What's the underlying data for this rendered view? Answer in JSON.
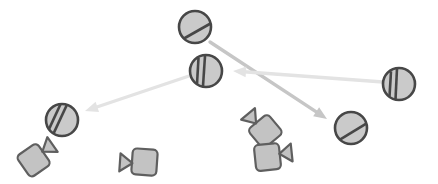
{
  "scene": {
    "description": "diagram of striped balls, video cameras and motion arrows",
    "width": 438,
    "height": 184,
    "background": "#ffffff",
    "colors": {
      "ball_fill": "#cacaca",
      "ball_stroke": "#474747",
      "camera_fill": "#c3c3c3",
      "camera_stroke": "#5f5f5f",
      "arrow_primary": "#c6c6c6",
      "arrow_faded": "#e3e3e3"
    },
    "balls": [
      {
        "id": "ball-top",
        "cx": 195,
        "cy": 27,
        "r": 16,
        "stripes": [
          [
            [
              184,
              38.5
            ],
            [
              210.5,
              23.5
            ]
          ]
        ]
      },
      {
        "id": "ball-middle",
        "cx": 206,
        "cy": 71,
        "r": 16,
        "stripes": [
          [
            [
              198.5,
              58
            ],
            [
              197,
              84
            ]
          ],
          [
            [
              205,
              56
            ],
            [
              203,
              86
            ]
          ]
        ]
      },
      {
        "id": "ball-right",
        "cx": 399,
        "cy": 84,
        "r": 16,
        "stripes": [
          [
            [
              391,
              71.4
            ],
            [
              389.5,
              96.6
            ]
          ],
          [
            [
              397,
              68.8
            ],
            [
              395.5,
              99.2
            ]
          ]
        ]
      },
      {
        "id": "ball-bottom-left",
        "cx": 62,
        "cy": 120,
        "r": 16,
        "stripes": [
          [
            [
              60.4,
              104.5
            ],
            [
              49.2,
              128.6
            ]
          ],
          [
            [
              66.7,
              105.2
            ],
            [
              53.7,
              133.1
            ]
          ]
        ]
      },
      {
        "id": "ball-bottom-right",
        "cx": 351,
        "cy": 128,
        "r": 16,
        "stripes": [
          [
            [
              339.5,
              139.8
            ],
            [
              365.8,
              123.8
            ]
          ]
        ]
      }
    ],
    "cameras": [
      {
        "id": "camera-bottom-left",
        "x": 34,
        "y": 160,
        "rotation": -35
      },
      {
        "id": "camera-bottom-center",
        "x": 144,
        "y": 162,
        "rotation": 184
      },
      {
        "id": "camera-mid-upper",
        "x": 265,
        "y": 131,
        "rotation": -130
      },
      {
        "id": "camera-mid-lower",
        "x": 268,
        "y": 157,
        "rotation": -6
      }
    ],
    "arrows": [
      {
        "id": "arrow-top-to-bottom-right",
        "x1": 210,
        "y1": 42,
        "x2": 327,
        "y2": 119,
        "color": "arrow_primary"
      },
      {
        "id": "arrow-right-to-middle",
        "x1": 383,
        "y1": 82,
        "x2": 233,
        "y2": 71,
        "color": "arrow_faded"
      },
      {
        "id": "arrow-middle-to-left",
        "x1": 192,
        "y1": 75,
        "x2": 85,
        "y2": 111,
        "color": "arrow_faded"
      }
    ]
  }
}
